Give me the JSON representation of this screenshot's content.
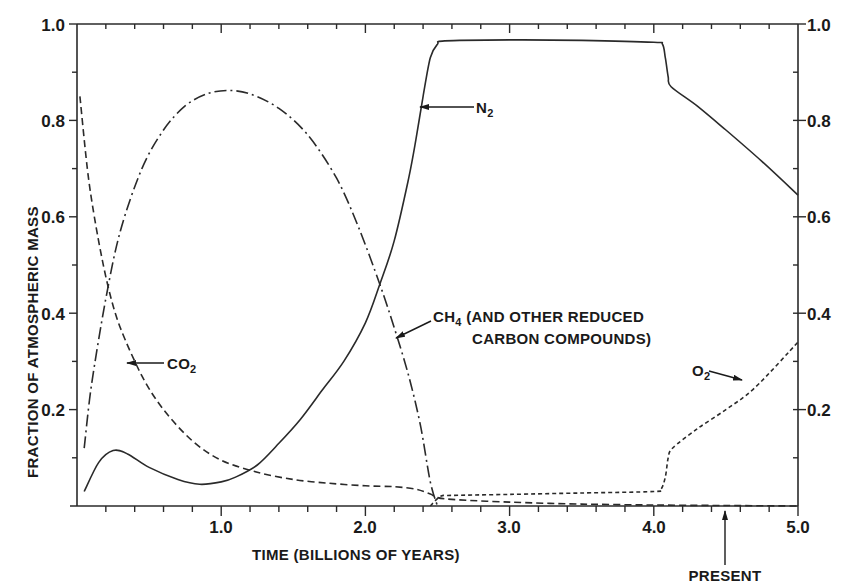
{
  "chart_data": {
    "type": "line",
    "title": "",
    "xlabel": "TIME (BILLIONS OF YEARS)",
    "ylabel": "FRACTION OF ATMOSPHERIC MASS",
    "xlim": [
      0,
      5.0
    ],
    "ylim": [
      0,
      1.0
    ],
    "x_ticks": [
      "1.0",
      "2.0",
      "3.0",
      "4.0",
      "5.0"
    ],
    "x_tick_values": [
      1.0,
      2.0,
      3.0,
      4.0,
      5.0
    ],
    "y_ticks_left": [
      "0.2",
      "0.4",
      "0.6",
      "0.8",
      "1.0"
    ],
    "y_ticks_right": [
      "0.2",
      "0.4",
      "0.6",
      "0.8",
      "1.0"
    ],
    "y_tick_values": [
      0.2,
      0.4,
      0.6,
      0.8,
      1.0
    ],
    "grid": false,
    "legend": "inline annotations with arrows",
    "series": [
      {
        "name": "N2",
        "label": "N",
        "label_sub": "2",
        "style": "solid",
        "x": [
          0.05,
          0.15,
          0.25,
          0.35,
          0.5,
          0.7,
          0.85,
          1.0,
          1.1,
          1.25,
          1.4,
          1.55,
          1.7,
          1.85,
          2.0,
          2.1,
          2.2,
          2.3,
          2.35,
          2.4,
          2.45,
          2.5,
          2.55,
          3.0,
          3.5,
          4.0,
          4.06,
          4.08,
          4.1,
          4.12,
          4.3,
          4.5,
          4.75,
          5.0
        ],
        "y": [
          0.03,
          0.09,
          0.115,
          0.108,
          0.08,
          0.055,
          0.045,
          0.05,
          0.06,
          0.085,
          0.13,
          0.18,
          0.24,
          0.3,
          0.38,
          0.46,
          0.55,
          0.68,
          0.76,
          0.85,
          0.93,
          0.958,
          0.965,
          0.967,
          0.966,
          0.962,
          0.958,
          0.93,
          0.89,
          0.87,
          0.83,
          0.78,
          0.715,
          0.645
        ]
      },
      {
        "name": "CH4 (AND OTHER REDUCED CARBON COMPOUNDS)",
        "label_line1_pre": "CH",
        "label_line1_sub": "4",
        "label_line1_post": " (AND OTHER REDUCED",
        "label_line2": "CARBON COMPOUNDS)",
        "style": "dash-dot",
        "x": [
          0.05,
          0.1,
          0.2,
          0.3,
          0.45,
          0.6,
          0.75,
          0.9,
          1.05,
          1.2,
          1.4,
          1.6,
          1.8,
          1.95,
          2.1,
          2.2,
          2.3,
          2.38,
          2.45,
          2.5
        ],
        "y": [
          0.12,
          0.25,
          0.43,
          0.57,
          0.7,
          0.78,
          0.83,
          0.855,
          0.862,
          0.855,
          0.825,
          0.77,
          0.68,
          0.58,
          0.46,
          0.37,
          0.27,
          0.17,
          0.05,
          0.0
        ]
      },
      {
        "name": "CO2",
        "label": "CO",
        "label_sub": "2",
        "style": "dashed",
        "x": [
          0.02,
          0.08,
          0.15,
          0.22,
          0.3,
          0.45,
          0.6,
          0.8,
          1.0,
          1.25,
          1.5,
          1.75,
          2.0,
          2.2,
          2.35,
          2.45,
          2.55,
          3.0,
          3.5,
          4.0,
          4.5,
          5.0
        ],
        "y": [
          0.85,
          0.68,
          0.55,
          0.45,
          0.37,
          0.27,
          0.2,
          0.135,
          0.095,
          0.07,
          0.055,
          0.047,
          0.042,
          0.04,
          0.035,
          0.025,
          0.015,
          0.008,
          0.004,
          0.002,
          0.001,
          0.0
        ]
      },
      {
        "name": "O2",
        "label": "O",
        "label_sub": "2",
        "style": "dotted",
        "x": [
          2.45,
          2.52,
          2.6,
          3.0,
          3.5,
          4.0,
          4.05,
          4.08,
          4.1,
          4.13,
          4.3,
          4.5,
          4.7,
          5.0
        ],
        "y": [
          0.0,
          0.02,
          0.022,
          0.024,
          0.027,
          0.03,
          0.035,
          0.06,
          0.1,
          0.12,
          0.16,
          0.2,
          0.245,
          0.34
        ]
      }
    ],
    "annotations": [
      {
        "text": "PRESENT",
        "x": 4.5,
        "arrow": "up to x-axis"
      }
    ]
  },
  "labels": {
    "xlabel": "TIME (BILLIONS OF YEARS)",
    "ylabel": "FRACTION OF ATMOSPHERIC MASS",
    "present": "PRESENT",
    "n2_main": "N",
    "n2_sub": "2",
    "co2_main": "CO",
    "co2_sub": "2",
    "o2_main": "O",
    "o2_sub": "2",
    "ch4_main": "CH",
    "ch4_sub": "4",
    "ch4_rest": " (AND OTHER REDUCED",
    "ch4_line2": "CARBON COMPOUNDS)"
  },
  "colors": {
    "ink": "#1a1a1a",
    "line": "#2a2a2a",
    "background": "#ffffff"
  }
}
